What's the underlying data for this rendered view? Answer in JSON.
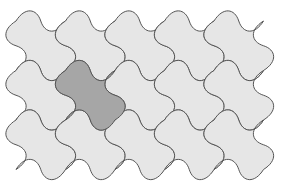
{
  "figure": {
    "title": "Curved-edge square tessellation",
    "grid": {
      "columns": 5,
      "rows": 3
    },
    "origin": {
      "x": 16,
      "y": 21
    },
    "cell": {
      "width": 49.5,
      "height": 49.5
    },
    "amplitude": 9,
    "colors": {
      "background": "#ffffff",
      "tile_fill": "#e6e6e6",
      "highlight_fill": "#a6a6a6",
      "stroke": "#555555"
    },
    "highlighted_tile": {
      "row": 1,
      "column": 1
    },
    "tiles": [
      {
        "row": 0,
        "column": 0,
        "highlighted": false
      },
      {
        "row": 0,
        "column": 1,
        "highlighted": false
      },
      {
        "row": 0,
        "column": 2,
        "highlighted": false
      },
      {
        "row": 0,
        "column": 3,
        "highlighted": false
      },
      {
        "row": 0,
        "column": 4,
        "highlighted": false
      },
      {
        "row": 1,
        "column": 0,
        "highlighted": false
      },
      {
        "row": 1,
        "column": 1,
        "highlighted": true
      },
      {
        "row": 1,
        "column": 2,
        "highlighted": false
      },
      {
        "row": 1,
        "column": 3,
        "highlighted": false
      },
      {
        "row": 1,
        "column": 4,
        "highlighted": false
      },
      {
        "row": 2,
        "column": 0,
        "highlighted": false
      },
      {
        "row": 2,
        "column": 1,
        "highlighted": false
      },
      {
        "row": 2,
        "column": 2,
        "highlighted": false
      },
      {
        "row": 2,
        "column": 3,
        "highlighted": false
      },
      {
        "row": 2,
        "column": 4,
        "highlighted": false
      }
    ]
  }
}
